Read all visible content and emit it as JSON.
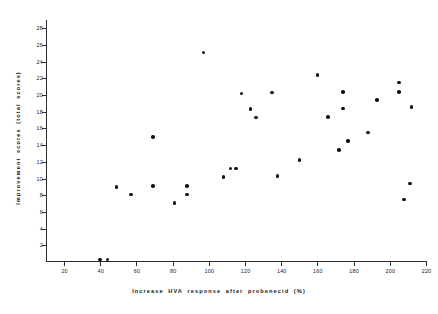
{
  "chart_data": {
    "type": "scatter",
    "title": "",
    "xlabel": "Increase HVA response after probenecid (%)",
    "ylabel": "Improvement scores (total scores)",
    "xlim": [
      10,
      220
    ],
    "ylim": [
      0,
      29
    ],
    "xticks": [
      20,
      40,
      60,
      80,
      100,
      120,
      140,
      160,
      180,
      200,
      220
    ],
    "yticks": [
      2,
      4,
      6,
      8,
      10,
      12,
      14,
      16,
      18,
      20,
      22,
      24,
      26,
      28
    ],
    "grid": false,
    "legend": null,
    "marker": "filled-circle",
    "marker_color": "#101010",
    "points": [
      {
        "x": 40,
        "y": 0.3
      },
      {
        "x": 44,
        "y": 0.3
      },
      {
        "x": 49,
        "y": 9.0
      },
      {
        "x": 57,
        "y": 8.1
      },
      {
        "x": 69,
        "y": 15.0
      },
      {
        "x": 69,
        "y": 9.1
      },
      {
        "x": 81,
        "y": 7.1
      },
      {
        "x": 88,
        "y": 9.1
      },
      {
        "x": 88,
        "y": 8.1
      },
      {
        "x": 97,
        "y": 25.1
      },
      {
        "x": 108,
        "y": 10.2
      },
      {
        "x": 112,
        "y": 11.2
      },
      {
        "x": 115,
        "y": 11.2
      },
      {
        "x": 118,
        "y": 20.2
      },
      {
        "x": 123,
        "y": 18.3
      },
      {
        "x": 126,
        "y": 17.3
      },
      {
        "x": 135,
        "y": 20.3
      },
      {
        "x": 138,
        "y": 10.3
      },
      {
        "x": 150,
        "y": 12.2
      },
      {
        "x": 160,
        "y": 22.4
      },
      {
        "x": 166,
        "y": 17.4
      },
      {
        "x": 172,
        "y": 13.4
      },
      {
        "x": 174,
        "y": 20.4
      },
      {
        "x": 174,
        "y": 18.4
      },
      {
        "x": 177,
        "y": 14.5
      },
      {
        "x": 188,
        "y": 15.5
      },
      {
        "x": 193,
        "y": 19.4
      },
      {
        "x": 205,
        "y": 21.5
      },
      {
        "x": 205,
        "y": 20.4
      },
      {
        "x": 208,
        "y": 7.5
      },
      {
        "x": 211,
        "y": 9.4
      },
      {
        "x": 212,
        "y": 18.6
      }
    ]
  }
}
